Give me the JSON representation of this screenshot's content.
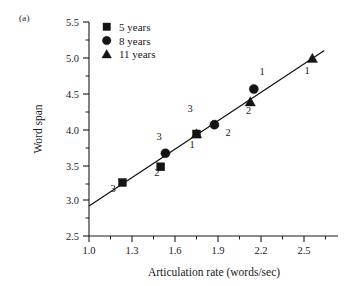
{
  "panel": {
    "label": "(a)"
  },
  "chart_data": {
    "type": "scatter",
    "title": "",
    "xlabel": "Articulation rate (words/sec)",
    "ylabel": "Word span",
    "xlim": [
      1.0,
      2.95
    ],
    "ylim": [
      2.5,
      5.5
    ],
    "xticks": [
      "1.0",
      "1.3",
      "1.6",
      "1.9",
      "2.2",
      "2.5",
      "2.8"
    ],
    "xtick_values": [
      1.0,
      1.3,
      1.6,
      1.9,
      2.2,
      2.5,
      2.8
    ],
    "yticks": [
      "2.5",
      "3.0",
      "3.5",
      "4.0",
      "4.5",
      "5.0",
      "5.5"
    ],
    "ytick_values": [
      2.5,
      3.0,
      3.5,
      4.0,
      4.5,
      5.0,
      5.5
    ],
    "grid": false,
    "legend_position": "top-left",
    "legend": [
      {
        "marker": "square",
        "label": "5 years"
      },
      {
        "marker": "circle",
        "label": "8 years"
      },
      {
        "marker": "triangle",
        "label": "11 years"
      }
    ],
    "series": [
      {
        "name": "5 years",
        "marker": "square",
        "points": [
          {
            "x": 1.28,
            "y": 3.25,
            "label": "3",
            "label_pos": "below"
          },
          {
            "x": 1.6,
            "y": 3.47,
            "label": "2",
            "label_pos": "below"
          },
          {
            "x": 1.9,
            "y": 3.93,
            "label": "1",
            "label_pos": "below"
          }
        ]
      },
      {
        "name": "8 years",
        "marker": "circle",
        "points": [
          {
            "x": 1.64,
            "y": 3.66,
            "label": "3",
            "label_pos": "above"
          },
          {
            "x": 2.05,
            "y": 4.06,
            "label": "2",
            "label_pos": "below-right"
          },
          {
            "x": 2.38,
            "y": 4.56,
            "label": "1",
            "label_pos": "above"
          }
        ]
      },
      {
        "name": "11 years",
        "marker": "triangle",
        "points": [
          {
            "x": 1.9,
            "y": 3.93,
            "label": "3",
            "label_pos": "above"
          },
          {
            "x": 2.35,
            "y": 4.38,
            "label": "2",
            "label_pos": "below"
          },
          {
            "x": 2.87,
            "y": 4.99,
            "label": "1",
            "label_pos": "below"
          }
        ]
      }
    ],
    "fit_line": {
      "x0": 1.0,
      "y0": 2.92,
      "x1": 2.97,
      "y1": 5.1
    }
  }
}
